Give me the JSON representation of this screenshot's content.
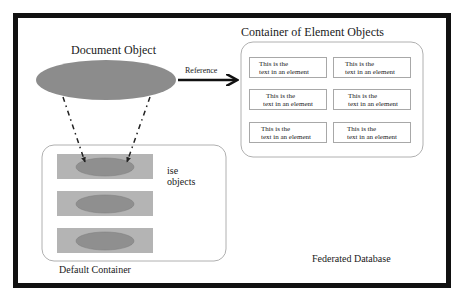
{
  "diagram": {
    "title": "Federated Database",
    "document_object": {
      "label": "Document Object",
      "shape": "ellipse",
      "fill": "#8c8c8c"
    },
    "reference_arrow": {
      "label": "Reference",
      "from": "Document Object",
      "to": "Container of Element Objects"
    },
    "element_container": {
      "label": "Container of Element Objects",
      "elements": [
        {
          "line1": "This is the",
          "line2": "text in an element"
        },
        {
          "line1": "This is the",
          "line2": "text in an element"
        },
        {
          "line1": "This is the",
          "line2": "text in an element"
        },
        {
          "line1": "This is the",
          "line2": "text in an element"
        },
        {
          "line1": "This is the",
          "line2": "text in an element"
        },
        {
          "line1": "This is the",
          "line2": "text in an element"
        }
      ]
    },
    "default_container": {
      "label": "Default Container",
      "ise_label_line1": "ise",
      "ise_label_line2": "objects",
      "ise_object_count": 3,
      "rect_fill": "#b4b4b4",
      "ellipse_fill": "#8f8f8f"
    },
    "colors": {
      "outer_border": "#111111",
      "container_stroke": "#b0b0b0",
      "arrow": "#111111"
    }
  }
}
